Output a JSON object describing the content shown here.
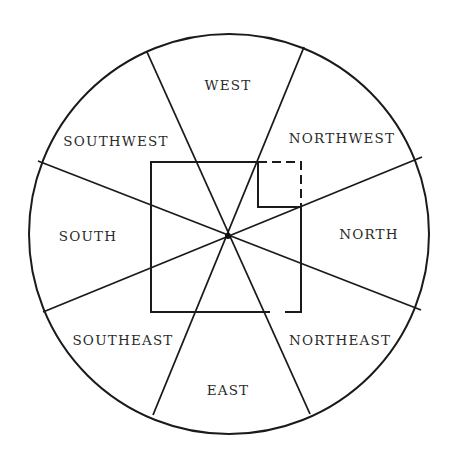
{
  "diagram": {
    "stroke_color": "#1a1a1a",
    "background": "#ffffff",
    "circle": {
      "cx": 229,
      "cy": 234,
      "r": 200
    },
    "center": {
      "x": 228,
      "y": 236
    },
    "spokes": [
      {
        "x1": 147,
        "y1": 52,
        "x2": 310,
        "y2": 414
      },
      {
        "x1": 304,
        "y1": 47,
        "x2": 153,
        "y2": 415
      },
      {
        "x1": 38,
        "y1": 161,
        "x2": 421,
        "y2": 310
      },
      {
        "x1": 43,
        "y1": 312,
        "x2": 422,
        "y2": 157
      }
    ],
    "house": {
      "left": 151,
      "top": 162,
      "right": 301,
      "bottom": 312,
      "notch_x": 258,
      "notch_y": 207,
      "door_gap": [
        270,
        285
      ]
    },
    "sectors": [
      {
        "id": "west",
        "label": "WEST",
        "x": 228,
        "y": 86
      },
      {
        "id": "northwest",
        "label": "NORTHWEST",
        "x": 342,
        "y": 139
      },
      {
        "id": "north",
        "label": "NORTH",
        "x": 369,
        "y": 235
      },
      {
        "id": "northeast",
        "label": "NORTHEAST",
        "x": 340,
        "y": 341
      },
      {
        "id": "east",
        "label": "EAST",
        "x": 228,
        "y": 391
      },
      {
        "id": "southeast",
        "label": "SOUTHEAST",
        "x": 123,
        "y": 341
      },
      {
        "id": "south",
        "label": "SOUTH",
        "x": 88,
        "y": 237
      },
      {
        "id": "southwest",
        "label": "SOUTHWEST",
        "x": 116,
        "y": 142
      }
    ]
  }
}
